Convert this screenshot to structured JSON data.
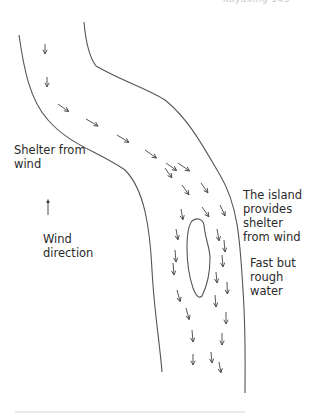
{
  "header": {
    "running_title": "Kayaking  143"
  },
  "diagram": {
    "stroke_color": "#555555",
    "arrow_color": "#444444",
    "banks": {
      "left": "M19,35 C24,70 30,100 48,120 C70,145 95,150 125,170 C145,190 150,230 152,270 C154,310 160,345 162,372",
      "right": "M84,22 C86,45 90,58 96,66 C120,80 150,90 165,100 C190,120 205,150 220,175 C238,205 240,240 243,290 C246,335 245,370 245,393"
    },
    "island": "M192,221 C197,217 203,219 204,225 C205,238 210,248 210,258 C210,272 207,286 202,296 C199,299 196,296 193,288 C189,276 187,262 187,248 C187,238 188,226 192,221 Z",
    "arrows": [
      {
        "x": 45,
        "y": 44,
        "angle": 90,
        "len": 10
      },
      {
        "x": 47,
        "y": 77,
        "angle": 90,
        "len": 10
      },
      {
        "x": 58,
        "y": 104,
        "angle": 35,
        "len": 13
      },
      {
        "x": 86,
        "y": 119,
        "angle": 30,
        "len": 14
      },
      {
        "x": 117,
        "y": 135,
        "angle": 32,
        "len": 14
      },
      {
        "x": 145,
        "y": 150,
        "angle": 35,
        "len": 14
      },
      {
        "x": 166,
        "y": 163,
        "angle": 35,
        "len": 13
      },
      {
        "x": 150,
        "y": 149,
        "angle": 40,
        "len": 0
      },
      {
        "x": 165,
        "y": 168,
        "angle": 55,
        "len": 12
      },
      {
        "x": 178,
        "y": 163,
        "angle": 35,
        "len": 14
      },
      {
        "x": 182,
        "y": 185,
        "angle": 55,
        "len": 12
      },
      {
        "x": 201,
        "y": 183,
        "angle": 55,
        "len": 12
      },
      {
        "x": 181,
        "y": 209,
        "angle": 80,
        "len": 11
      },
      {
        "x": 202,
        "y": 207,
        "angle": 55,
        "len": 12
      },
      {
        "x": 220,
        "y": 205,
        "angle": 65,
        "len": 12
      },
      {
        "x": 176,
        "y": 229,
        "angle": 80,
        "len": 11
      },
      {
        "x": 217,
        "y": 229,
        "angle": 80,
        "len": 12
      },
      {
        "x": 175,
        "y": 250,
        "angle": 85,
        "len": 12
      },
      {
        "x": 224,
        "y": 240,
        "angle": 85,
        "len": 12
      },
      {
        "x": 222,
        "y": 255,
        "angle": 85,
        "len": 12
      },
      {
        "x": 173,
        "y": 263,
        "angle": 85,
        "len": 12
      },
      {
        "x": 216,
        "y": 272,
        "angle": 85,
        "len": 11
      },
      {
        "x": 227,
        "y": 282,
        "angle": 88,
        "len": 12
      },
      {
        "x": 177,
        "y": 290,
        "angle": 75,
        "len": 12
      },
      {
        "x": 215,
        "y": 295,
        "angle": 85,
        "len": 12
      },
      {
        "x": 186,
        "y": 308,
        "angle": 75,
        "len": 12
      },
      {
        "x": 226,
        "y": 312,
        "angle": 90,
        "len": 12
      },
      {
        "x": 192,
        "y": 330,
        "angle": 85,
        "len": 12
      },
      {
        "x": 222,
        "y": 333,
        "angle": 90,
        "len": 12
      },
      {
        "x": 193,
        "y": 354,
        "angle": 90,
        "len": 11
      },
      {
        "x": 211,
        "y": 352,
        "angle": 85,
        "len": 11
      },
      {
        "x": 219,
        "y": 362,
        "angle": 80,
        "len": 11
      }
    ],
    "wind_arrow": {
      "x": 48,
      "y": 215,
      "length": 14
    }
  },
  "labels": {
    "shelter_from_wind": "Shelter from\nwind",
    "wind_direction": "Wind\ndirection",
    "island_shelter": "The island\nprovides\nshelter\nfrom wind",
    "fast_rough_water": "Fast but\nrough\nwater"
  }
}
